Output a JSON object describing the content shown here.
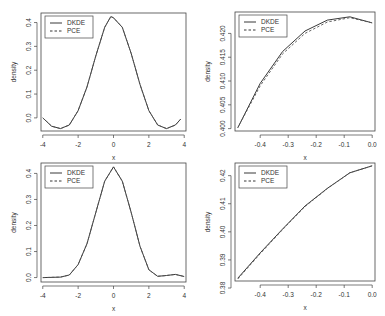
{
  "chart_data": [
    {
      "type": "line",
      "panel": "top-left",
      "title": "",
      "xlabel": "x",
      "ylabel": "density",
      "xlim": [
        -4.1,
        4.1
      ],
      "ylim": [
        -0.055,
        0.44
      ],
      "xticks": [
        -4,
        -2,
        0,
        2,
        4
      ],
      "xtick_labels": [
        "-4",
        "-2",
        "0",
        "2",
        "4"
      ],
      "yticks": [
        0.0,
        0.1,
        0.2,
        0.3,
        0.4
      ],
      "ytick_labels": [
        "0.0",
        "0.1",
        "0.2",
        "0.3",
        "0.4"
      ],
      "grid": false,
      "legend": {
        "position": "topleft",
        "entries": [
          "DKDE",
          "PCE"
        ]
      },
      "series": [
        {
          "name": "DKDE",
          "style": "solid",
          "x": [
            -4.0,
            -3.5,
            -3.0,
            -2.5,
            -2.0,
            -1.5,
            -1.0,
            -0.5,
            -0.15,
            0.0,
            0.5,
            1.0,
            1.5,
            2.0,
            2.5,
            3.0,
            3.5,
            3.8
          ],
          "y": [
            0.0,
            -0.035,
            -0.045,
            -0.03,
            0.03,
            0.13,
            0.26,
            0.38,
            0.425,
            0.42,
            0.38,
            0.27,
            0.14,
            0.03,
            -0.03,
            -0.045,
            -0.03,
            -0.005
          ]
        },
        {
          "name": "PCE",
          "style": "dashed",
          "x": [
            -4.0,
            -3.5,
            -3.0,
            -2.5,
            -2.0,
            -1.5,
            -1.0,
            -0.5,
            -0.15,
            0.0,
            0.5,
            1.0,
            1.5,
            2.0,
            2.5,
            3.0,
            3.5,
            3.8
          ],
          "y": [
            0.0,
            -0.035,
            -0.045,
            -0.03,
            0.03,
            0.13,
            0.26,
            0.38,
            0.425,
            0.42,
            0.38,
            0.27,
            0.14,
            0.03,
            -0.03,
            -0.045,
            -0.03,
            -0.005
          ]
        }
      ]
    },
    {
      "type": "line",
      "panel": "top-right",
      "title": "",
      "xlabel": "x",
      "ylabel": "density",
      "xlim": [
        -0.49,
        0.01
      ],
      "ylim": [
        0.3995,
        0.4245
      ],
      "xticks": [
        -0.4,
        -0.3,
        -0.2,
        -0.1,
        0.0
      ],
      "xtick_labels": [
        "-0.4",
        "-0.3",
        "-0.2",
        "-0.1",
        "0.0"
      ],
      "yticks": [
        0.4,
        0.405,
        0.41,
        0.415,
        0.42
      ],
      "ytick_labels": [
        "0.400",
        "0.405",
        "0.410",
        "0.415",
        "0.420"
      ],
      "grid": false,
      "legend": {
        "position": "topleft",
        "entries": [
          "DKDE",
          "PCE"
        ]
      },
      "series": [
        {
          "name": "DKDE",
          "style": "solid",
          "x": [
            -0.48,
            -0.4,
            -0.32,
            -0.24,
            -0.16,
            -0.08,
            0.0
          ],
          "y": [
            0.4002,
            0.4095,
            0.4162,
            0.4205,
            0.4228,
            0.4235,
            0.4222
          ]
        },
        {
          "name": "PCE",
          "style": "dashed",
          "x": [
            -0.48,
            -0.4,
            -0.32,
            -0.24,
            -0.16,
            -0.08,
            0.0
          ],
          "y": [
            0.4002,
            0.409,
            0.4157,
            0.42,
            0.4224,
            0.4233,
            0.4222
          ]
        }
      ]
    },
    {
      "type": "line",
      "panel": "bottom-left",
      "title": "",
      "xlabel": "x",
      "ylabel": "density",
      "xlim": [
        -4.1,
        4.1
      ],
      "ylim": [
        -0.017,
        0.44
      ],
      "xticks": [
        -4,
        -2,
        0,
        2,
        4
      ],
      "xtick_labels": [
        "-4",
        "-2",
        "0",
        "2",
        "4"
      ],
      "yticks": [
        0.0,
        0.1,
        0.2,
        0.3,
        0.4
      ],
      "ytick_labels": [
        "0.0",
        "0.1",
        "0.2",
        "0.3",
        "0.4"
      ],
      "grid": false,
      "legend": {
        "position": "topleft",
        "entries": [
          "DKDE",
          "PCE"
        ]
      },
      "series": [
        {
          "name": "DKDE",
          "style": "solid",
          "x": [
            -4.0,
            -3.0,
            -2.5,
            -2.0,
            -1.5,
            -1.0,
            -0.5,
            0.0,
            0.5,
            1.0,
            1.5,
            2.0,
            2.5,
            3.0,
            3.5,
            4.0
          ],
          "y": [
            0.0,
            0.002,
            0.01,
            0.05,
            0.13,
            0.25,
            0.37,
            0.425,
            0.37,
            0.25,
            0.12,
            0.03,
            0.005,
            0.008,
            0.012,
            0.004
          ]
        },
        {
          "name": "PCE",
          "style": "dashed",
          "x": [
            -4.0,
            -3.0,
            -2.5,
            -2.0,
            -1.5,
            -1.0,
            -0.5,
            0.0,
            0.5,
            1.0,
            1.5,
            2.0,
            2.5,
            3.0,
            3.5,
            4.0
          ],
          "y": [
            0.0,
            0.002,
            0.01,
            0.05,
            0.13,
            0.25,
            0.37,
            0.425,
            0.37,
            0.25,
            0.12,
            0.03,
            0.005,
            0.008,
            0.012,
            0.004
          ]
        }
      ]
    },
    {
      "type": "line",
      "panel": "bottom-right",
      "title": "",
      "xlabel": "x",
      "ylabel": "density",
      "xlim": [
        -0.49,
        0.01
      ],
      "ylim": [
        0.3825,
        0.4245
      ],
      "xticks": [
        -0.4,
        -0.3,
        -0.2,
        -0.1,
        0.0
      ],
      "xtick_labels": [
        "-0.4",
        "-0.3",
        "-0.2",
        "-0.1",
        "0.0"
      ],
      "yticks": [
        0.38,
        0.39,
        0.4,
        0.41,
        0.42
      ],
      "ytick_labels": [
        "0.38",
        "0.39",
        "0.40",
        "0.41",
        "0.42"
      ],
      "grid": false,
      "legend": {
        "position": "topleft",
        "entries": [
          "DKDE",
          "PCE"
        ]
      },
      "series": [
        {
          "name": "DKDE",
          "style": "solid",
          "x": [
            -0.48,
            -0.4,
            -0.32,
            -0.24,
            -0.16,
            -0.08,
            0.0
          ],
          "y": [
            0.3835,
            0.3925,
            0.401,
            0.4092,
            0.4155,
            0.421,
            0.4235
          ]
        },
        {
          "name": "PCE",
          "style": "dashed",
          "x": [
            -0.48,
            -0.4,
            -0.32,
            -0.24,
            -0.16,
            -0.08,
            0.0
          ],
          "y": [
            0.3832,
            0.3922,
            0.4008,
            0.409,
            0.4154,
            0.421,
            0.4235
          ]
        }
      ]
    }
  ],
  "panels_layout": [
    {
      "frame": [
        41,
        13,
        186,
        131
      ]
    },
    {
      "frame": [
        235,
        12,
        375,
        131
      ]
    },
    {
      "frame": [
        41,
        163,
        186,
        282
      ]
    },
    {
      "frame": [
        235,
        163,
        375,
        281
      ]
    }
  ],
  "colors": {
    "line": "#222222",
    "frame": "#444444",
    "text": "#333333"
  }
}
